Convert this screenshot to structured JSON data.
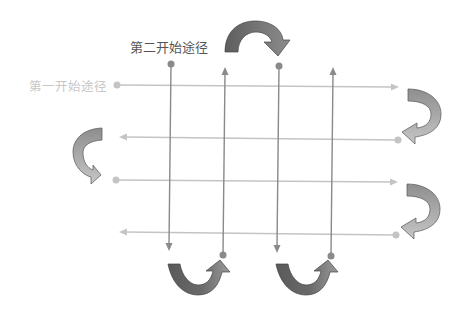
{
  "labels": {
    "first_start_path": "第一开始途径",
    "second_start_path": "第二开始途径"
  },
  "colors": {
    "horizontal_line": "#c4c4c4",
    "vertical_line": "#8a8a8a",
    "first_label": "#c8c8c8",
    "second_label": "#555555",
    "arrow_dark": "#6b6b6b",
    "arrow_mid": "#9a9a9a",
    "arrow_light": "#bcbcbc"
  },
  "horizontal_paths": [
    {
      "y": 85,
      "from_x": 117,
      "to_x": 398,
      "direction": "right"
    },
    {
      "y": 138,
      "from_x": 398,
      "to_x": 120,
      "direction": "left"
    },
    {
      "y": 180,
      "from_x": 117,
      "to_x": 397,
      "direction": "right"
    },
    {
      "y": 233,
      "from_x": 398,
      "to_x": 120,
      "direction": "left"
    }
  ],
  "vertical_paths": [
    {
      "x": 170,
      "from_y": 64,
      "to_y": 250,
      "direction": "down"
    },
    {
      "x": 225,
      "from_y": 255,
      "to_y": 68,
      "direction": "up"
    },
    {
      "x": 279,
      "from_y": 66,
      "to_y": 252,
      "direction": "down"
    },
    {
      "x": 332,
      "from_y": 256,
      "to_y": 68,
      "direction": "up"
    }
  ],
  "turn_arrows": [
    {
      "name": "top-turn-arrow",
      "position": "top between columns 2 and 3",
      "turn": "clockwise-down"
    },
    {
      "name": "right-turn-arrow-1",
      "position": "right between rows 1 and 2",
      "turn": "right-to-left"
    },
    {
      "name": "left-turn-arrow",
      "position": "left between rows 2 and 3",
      "turn": "left-to-right"
    },
    {
      "name": "right-turn-arrow-2",
      "position": "right between rows 3 and 4",
      "turn": "right-to-left"
    },
    {
      "name": "bottom-turn-arrow-1",
      "position": "bottom between columns 1 and 2",
      "turn": "down-to-up"
    },
    {
      "name": "bottom-turn-arrow-2",
      "position": "bottom between columns 3 and 4",
      "turn": "down-to-up"
    }
  ]
}
